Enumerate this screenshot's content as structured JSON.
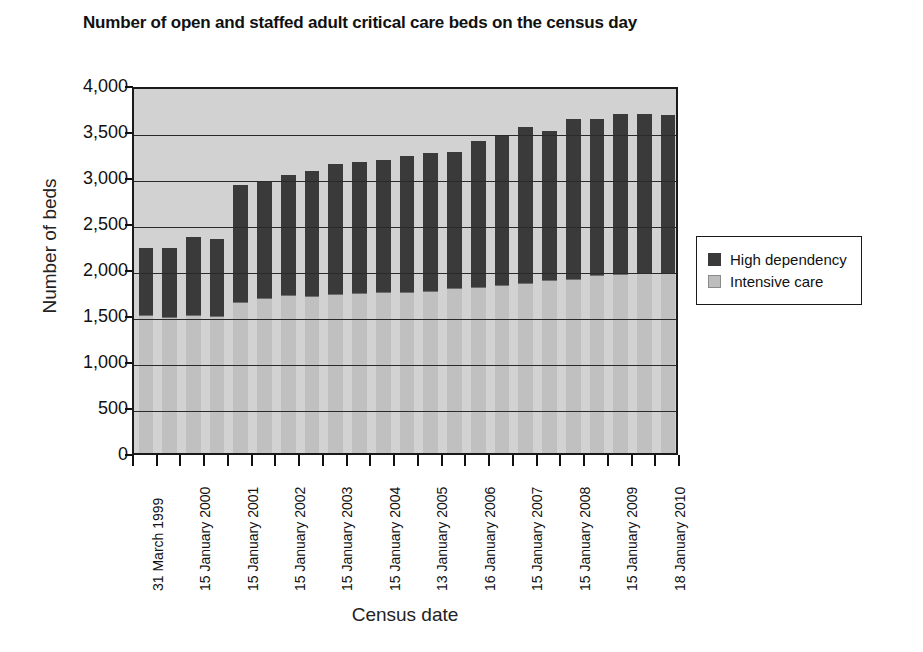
{
  "chart_data": {
    "type": "bar",
    "subtype": "stacked-vertical",
    "title": "Number of open and staffed adult critical care beds on the census day",
    "xlabel": "Census date",
    "ylabel": "Number of beds",
    "ylim": [
      0,
      4000
    ],
    "ytick_step": 500,
    "ytick_labels": [
      "4,000",
      "3,500",
      "3,000",
      "2,500",
      "2,000",
      "1,500",
      "1,000",
      "500",
      "0"
    ],
    "ytick_values": [
      4000,
      3500,
      3000,
      2500,
      2000,
      1500,
      1000,
      500,
      0
    ],
    "grid": true,
    "grid_axis": "y",
    "legend_position": "right",
    "categories": [
      "31 March 1999",
      "",
      "15 January 2000",
      "",
      "15 January 2001",
      "",
      "15 January 2002",
      "",
      "15 January 2003",
      "",
      "15 January 2004",
      "",
      "13 January 2005",
      "",
      "16 January 2006",
      "",
      "15 January 2007",
      "",
      "15 January 2008",
      "",
      "15 January 2009",
      "",
      "18 January 2010"
    ],
    "tick_labels": [
      "31 March 1999",
      "15 January 2000",
      "15 January 2001",
      "15 January 2002",
      "15 January 2003",
      "15 January 2004",
      "13 January 2005",
      "16 January 2006",
      "15 January 2007",
      "15 January 2008",
      "15 January 2009",
      "18 January 2010"
    ],
    "series": [
      {
        "name": "Intensive care",
        "color": "#c0c0c0",
        "values": [
          1500,
          1480,
          1500,
          1490,
          1640,
          1680,
          1710,
          1700,
          1720,
          1730,
          1740,
          1750,
          1760,
          1790,
          1800,
          1820,
          1840,
          1880,
          1890,
          1930,
          1940,
          1950,
          1950
        ]
      },
      {
        "name": "High dependency",
        "color": "#3a3a3a",
        "values": [
          730,
          750,
          850,
          840,
          1270,
          1270,
          1310,
          1370,
          1420,
          1430,
          1440,
          1480,
          1500,
          1480,
          1590,
          1630,
          1700,
          1620,
          1740,
          1700,
          1740,
          1740,
          1720
        ]
      }
    ],
    "totals": [
      2230,
      2230,
      2350,
      2330,
      2910,
      2950,
      3020,
      3070,
      3140,
      3160,
      3180,
      3230,
      3260,
      3270,
      3390,
      3450,
      3540,
      3500,
      3630,
      3630,
      3680,
      3690,
      3670
    ],
    "bar_count": 23
  },
  "legend": {
    "items": [
      {
        "label": "High dependency",
        "swatch": "dark-square-swatch"
      },
      {
        "label": "Intensive care",
        "swatch": "light-square-swatch"
      }
    ]
  }
}
